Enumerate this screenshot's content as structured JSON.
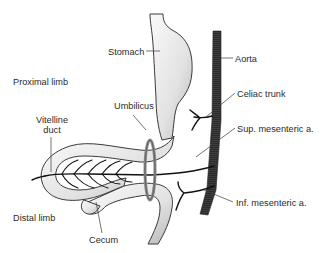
{
  "labels": {
    "stomach": "Stomach",
    "aorta": "Aorta",
    "proximal_limb": "Proximal limb",
    "umbilicus": "Umbilicus",
    "celiac_trunk": "Celiac trunk",
    "vitelline_duct_line1": "Vitelline",
    "vitelline_duct_line2": "duct",
    "sup_mesenteric": "Sup. mesenteric a.",
    "distal_limb": "Distal limb",
    "inf_mesenteric": "Inf. mesenteric a.",
    "cecum": "Cecum"
  },
  "colors": {
    "gut_fill_light": "#f4f4f4",
    "gut_fill_dark": "#b9b9b9",
    "outline": "#3a3a3a",
    "aorta": "#2b2b2b",
    "umbilical_ring": "#8a8a8a",
    "text": "#2a2a2a"
  }
}
